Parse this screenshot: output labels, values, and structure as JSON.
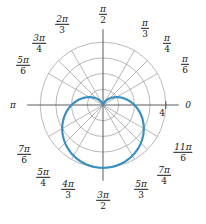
{
  "figure": {
    "kind": "polar-plot",
    "width": 206,
    "height": 224,
    "background": "#ffffff"
  },
  "chart_data": {
    "type": "line",
    "subtype": "polar",
    "title": "",
    "xlabel": "",
    "ylabel": "",
    "curve_name": "cardioid",
    "equation": "r = 2(1 - sin(theta))",
    "curve_color": "#3a8fc0",
    "curve_width": 2.2,
    "grid": true,
    "grid_color": "#9a9a9a",
    "axis_color": "#4a4a4a",
    "legend": "none",
    "radial": {
      "max": 4,
      "circles": [
        1,
        2,
        3,
        4
      ],
      "tick_labels": [
        "4"
      ],
      "tick_label_radius": 4
    },
    "angular": {
      "spoke_count": 12,
      "spoke_step_deg": 30,
      "diagonal_spokes_deg": [
        45,
        135,
        225,
        315
      ]
    },
    "theta_labels": [
      {
        "id": "theta-0",
        "text_plain": "0",
        "num": "",
        "den": "",
        "deg": 0,
        "x": 188,
        "y": 105
      },
      {
        "id": "theta-pi6",
        "text_plain": "",
        "num": "π",
        "den": "6",
        "deg": 30,
        "x": 185,
        "y": 65
      },
      {
        "id": "theta-pi4",
        "text_plain": "",
        "num": "π",
        "den": "4",
        "deg": 45,
        "x": 167,
        "y": 44
      },
      {
        "id": "theta-pi3",
        "text_plain": "",
        "num": "π",
        "den": "3",
        "deg": 60,
        "x": 145,
        "y": 29
      },
      {
        "id": "theta-pi2",
        "text_plain": "",
        "num": "π",
        "den": "2",
        "deg": 90,
        "x": 103,
        "y": 15
      },
      {
        "id": "theta-2pi3",
        "text_plain": "",
        "num": "2π",
        "den": "3",
        "deg": 120,
        "x": 62,
        "y": 25
      },
      {
        "id": "theta-3pi4",
        "text_plain": "",
        "num": "3π",
        "den": "4",
        "deg": 135,
        "x": 39,
        "y": 44
      },
      {
        "id": "theta-5pi6",
        "text_plain": "",
        "num": "5π",
        "den": "6",
        "deg": 150,
        "x": 23,
        "y": 66
      },
      {
        "id": "theta-pi",
        "text_plain": "π",
        "num": "",
        "den": "",
        "deg": 180,
        "x": 13,
        "y": 105
      },
      {
        "id": "theta-7pi6",
        "text_plain": "",
        "num": "7π",
        "den": "6",
        "deg": 210,
        "x": 24,
        "y": 155
      },
      {
        "id": "theta-5pi4",
        "text_plain": "",
        "num": "5π",
        "den": "4",
        "deg": 225,
        "x": 43,
        "y": 178
      },
      {
        "id": "theta-4pi3",
        "text_plain": "",
        "num": "4π",
        "den": "3",
        "deg": 240,
        "x": 68,
        "y": 190
      },
      {
        "id": "theta-3pi2",
        "text_plain": "",
        "num": "3π",
        "den": "2",
        "deg": 270,
        "x": 103,
        "y": 201
      },
      {
        "id": "theta-5pi3",
        "text_plain": "",
        "num": "5π",
        "den": "3",
        "deg": 300,
        "x": 141,
        "y": 190
      },
      {
        "id": "theta-7pi4",
        "text_plain": "",
        "num": "7π",
        "den": "4",
        "deg": 315,
        "x": 164,
        "y": 176
      },
      {
        "id": "theta-11pi6",
        "text_plain": "",
        "num": "11π",
        "den": "6",
        "deg": 330,
        "x": 183,
        "y": 153
      }
    ],
    "radial_tick": {
      "label": "4",
      "x": 162,
      "y": 113
    },
    "points_theta_r": [
      {
        "theta_deg": 90,
        "r": 0.0
      },
      {
        "theta_deg": 120,
        "r": 0.27
      },
      {
        "theta_deg": 150,
        "r": 1.0
      },
      {
        "theta_deg": 180,
        "r": 2.0
      },
      {
        "theta_deg": 210,
        "r": 3.0
      },
      {
        "theta_deg": 240,
        "r": 3.73
      },
      {
        "theta_deg": 270,
        "r": 4.0
      },
      {
        "theta_deg": 300,
        "r": 3.73
      },
      {
        "theta_deg": 330,
        "r": 3.0
      },
      {
        "theta_deg": 0,
        "r": 2.0
      },
      {
        "theta_deg": 30,
        "r": 1.0
      },
      {
        "theta_deg": 60,
        "r": 0.27
      }
    ]
  },
  "geometry": {
    "center_x": 103,
    "center_y": 105,
    "unit_px": 15.7
  }
}
